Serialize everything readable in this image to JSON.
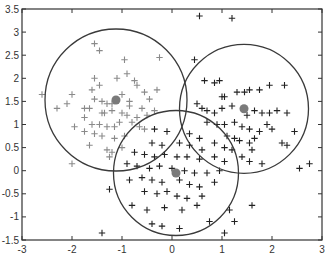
{
  "chart_data": {
    "type": "scatter",
    "title": "",
    "xlabel": "",
    "ylabel": "",
    "xlim": [
      -3,
      3
    ],
    "ylim": [
      -1.5,
      3.5
    ],
    "grid": false,
    "legend": null,
    "xticks": [
      "-3",
      "-2",
      "-1",
      "0",
      "1",
      "2",
      "3"
    ],
    "yticks": [
      "3.5",
      "3",
      "2.5",
      "2",
      "1.5",
      "1",
      "0.5",
      "0",
      "-0.5",
      "-1",
      "-1.5"
    ],
    "marker": "+",
    "clusters": [
      {
        "name": "cluster-1",
        "color": "#8a8a8a",
        "center": [
          -1.12,
          1.53
        ],
        "radius": 1.42,
        "points": [
          [
            -1.55,
            2.75
          ],
          [
            -1.45,
            2.6
          ],
          [
            -0.95,
            2.4
          ],
          [
            -0.25,
            2.45
          ],
          [
            -0.9,
            2.1
          ],
          [
            -1.55,
            2.0
          ],
          [
            -1.1,
            2.0
          ],
          [
            -1.6,
            1.75
          ],
          [
            -0.75,
            1.95
          ],
          [
            -0.7,
            1.85
          ],
          [
            -0.3,
            1.75
          ],
          [
            -0.55,
            1.7
          ],
          [
            -0.45,
            1.55
          ],
          [
            -1.55,
            1.55
          ],
          [
            -1.4,
            1.5
          ],
          [
            -1.3,
            1.45
          ],
          [
            -1.2,
            1.45
          ],
          [
            -0.85,
            1.5
          ],
          [
            -2.0,
            1.65
          ],
          [
            -2.3,
            1.35
          ],
          [
            -2.1,
            1.45
          ],
          [
            -1.75,
            1.35
          ],
          [
            -1.65,
            1.35
          ],
          [
            -1.4,
            1.25
          ],
          [
            -1.35,
            1.25
          ],
          [
            -1.2,
            1.3
          ],
          [
            -1.0,
            1.25
          ],
          [
            -0.9,
            1.2
          ],
          [
            -0.7,
            1.15
          ],
          [
            -0.6,
            1.35
          ],
          [
            -0.5,
            1.2
          ],
          [
            -0.35,
            1.3
          ],
          [
            -1.95,
            0.95
          ],
          [
            -1.6,
            1.0
          ],
          [
            -1.45,
            1.0
          ],
          [
            -1.3,
            0.95
          ],
          [
            -1.15,
            0.95
          ],
          [
            -1.05,
            1.05
          ],
          [
            -0.8,
            1.05
          ],
          [
            -0.65,
            0.95
          ],
          [
            -0.55,
            0.9
          ],
          [
            -1.75,
            0.85
          ],
          [
            -1.55,
            0.8
          ],
          [
            -1.4,
            0.75
          ],
          [
            -1.15,
            0.7
          ],
          [
            -0.95,
            0.75
          ],
          [
            -1.65,
            0.55
          ],
          [
            -1.3,
            0.45
          ],
          [
            -1.2,
            0.4
          ],
          [
            -1.25,
            0.3
          ],
          [
            -1.0,
            0.5
          ],
          [
            -2.0,
            0.15
          ],
          [
            -2.6,
            1.65
          ],
          [
            -1.45,
            1.85
          ],
          [
            -1.0,
            1.65
          ],
          [
            -0.85,
            1.4
          ],
          [
            -1.75,
            1.15
          ]
        ]
      },
      {
        "name": "cluster-2",
        "color": "#222222",
        "center": [
          1.44,
          1.34
        ],
        "radius": 1.29,
        "points": [
          [
            0.55,
            3.35
          ],
          [
            1.2,
            3.3
          ],
          [
            0.45,
            2.4
          ],
          [
            0.65,
            1.95
          ],
          [
            0.85,
            1.9
          ],
          [
            0.95,
            1.95
          ],
          [
            1.95,
            1.85
          ],
          [
            1.0,
            1.6
          ],
          [
            1.05,
            1.6
          ],
          [
            1.3,
            1.7
          ],
          [
            1.45,
            1.7
          ],
          [
            1.55,
            1.75
          ],
          [
            1.75,
            1.75
          ],
          [
            2.25,
            1.85
          ],
          [
            0.5,
            1.45
          ],
          [
            0.6,
            1.35
          ],
          [
            0.7,
            1.3
          ],
          [
            0.85,
            1.25
          ],
          [
            1.0,
            1.35
          ],
          [
            1.2,
            1.4
          ],
          [
            1.5,
            1.2
          ],
          [
            1.65,
            1.3
          ],
          [
            1.8,
            1.25
          ],
          [
            1.95,
            1.25
          ],
          [
            2.1,
            1.3
          ],
          [
            2.3,
            1.25
          ],
          [
            0.7,
            1.05
          ],
          [
            0.9,
            1.0
          ],
          [
            1.05,
            1.0
          ],
          [
            1.25,
            1.05
          ],
          [
            1.4,
            0.95
          ],
          [
            1.55,
            0.9
          ],
          [
            1.75,
            0.85
          ],
          [
            1.9,
            1.0
          ],
          [
            2.0,
            0.9
          ],
          [
            2.45,
            0.85
          ],
          [
            2.2,
            0.6
          ],
          [
            2.3,
            0.55
          ],
          [
            1.1,
            0.75
          ],
          [
            1.25,
            0.7
          ],
          [
            1.35,
            0.65
          ],
          [
            1.55,
            0.6
          ],
          [
            1.65,
            0.7
          ],
          [
            0.85,
            0.6
          ],
          [
            1.05,
            0.5
          ],
          [
            1.2,
            0.45
          ],
          [
            1.4,
            0.3
          ],
          [
            1.55,
            0.2
          ],
          [
            1.8,
            0.15
          ],
          [
            2.55,
            0.05
          ],
          [
            2.75,
            0.15
          ],
          [
            1.6,
            0.45
          ]
        ]
      },
      {
        "name": "cluster-3",
        "color": "#222222",
        "center": [
          0.08,
          -0.05
        ],
        "radius": 1.25,
        "points": [
          [
            -0.35,
            0.9
          ],
          [
            -0.1,
            0.85
          ],
          [
            0.35,
            0.8
          ],
          [
            0.55,
            0.7
          ],
          [
            -0.4,
            0.6
          ],
          [
            -0.2,
            0.55
          ],
          [
            0.15,
            0.6
          ],
          [
            0.35,
            0.55
          ],
          [
            0.6,
            0.45
          ],
          [
            -0.75,
            0.4
          ],
          [
            -0.55,
            0.35
          ],
          [
            -0.35,
            0.3
          ],
          [
            -0.15,
            0.35
          ],
          [
            0.1,
            0.3
          ],
          [
            0.3,
            0.3
          ],
          [
            0.55,
            0.25
          ],
          [
            0.85,
            0.3
          ],
          [
            1.05,
            0.2
          ],
          [
            -0.9,
            0.15
          ],
          [
            -0.7,
            0.1
          ],
          [
            -0.45,
            0.05
          ],
          [
            -0.25,
            0.1
          ],
          [
            0.0,
            0.05
          ],
          [
            0.25,
            0.0
          ],
          [
            0.45,
            -0.05
          ],
          [
            0.7,
            -0.05
          ],
          [
            0.95,
            0.0
          ],
          [
            -0.85,
            -0.2
          ],
          [
            -0.6,
            -0.15
          ],
          [
            -0.4,
            -0.2
          ],
          [
            -0.2,
            -0.25
          ],
          [
            0.15,
            -0.2
          ],
          [
            0.35,
            -0.3
          ],
          [
            0.55,
            -0.35
          ],
          [
            0.85,
            -0.25
          ],
          [
            -0.55,
            -0.45
          ],
          [
            -0.3,
            -0.5
          ],
          [
            -0.1,
            -0.45
          ],
          [
            0.1,
            -0.55
          ],
          [
            0.3,
            -0.6
          ],
          [
            0.6,
            -0.55
          ],
          [
            -0.8,
            -0.75
          ],
          [
            -0.5,
            -0.85
          ],
          [
            -0.15,
            -0.8
          ],
          [
            0.2,
            -0.85
          ],
          [
            0.5,
            -0.75
          ],
          [
            1.15,
            -0.85
          ],
          [
            -0.4,
            -1.15
          ],
          [
            -0.2,
            -1.2
          ],
          [
            0.15,
            -1.25
          ],
          [
            0.75,
            -1.1
          ],
          [
            1.25,
            -1.1
          ],
          [
            1.05,
            -1.35
          ],
          [
            -1.4,
            -1.35
          ],
          [
            -1.25,
            -0.4
          ],
          [
            1.6,
            -0.75
          ]
        ]
      }
    ]
  }
}
